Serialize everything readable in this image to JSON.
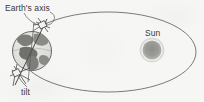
{
  "figure": {
    "background_color": "#f6f6f5",
    "ink_color": "#4a4a48"
  },
  "labels": {
    "earths_axis": "Earth's axis",
    "tilt": "tilt",
    "sun": "Sun"
  },
  "diagram": {
    "orbit": {
      "name": "orbit-ellipse",
      "center_x": 108,
      "center_y": 52,
      "radius_x": 88,
      "radius_y": 40,
      "stroke": "#6b6b68",
      "stroke_width": 0.9,
      "fill": "none"
    },
    "sun": {
      "name": "sun-disc",
      "center_x": 152,
      "center_y": 50,
      "radius": 9.5,
      "fill": "#9a9a97"
    },
    "earth": {
      "name": "earth-globe",
      "center_x": 32,
      "center_y": 51,
      "radius": 20,
      "stroke": "#5a5a57",
      "fill": "#e2e2e0",
      "continent_fill": "#7d7d7a"
    },
    "axis_line": {
      "name": "earth-axis-line",
      "x1": 46,
      "y1": 20,
      "x2": 16,
      "y2": 84,
      "stroke": "#4a4a48",
      "tilt_degrees": 23.5
    },
    "leader_lines": [
      {
        "name": "leader-earths-axis",
        "from_label": "Earth's axis",
        "to": "axis top marker"
      },
      {
        "name": "leader-tilt",
        "from_label": "tilt",
        "to": "axis bottom marker"
      }
    ]
  }
}
